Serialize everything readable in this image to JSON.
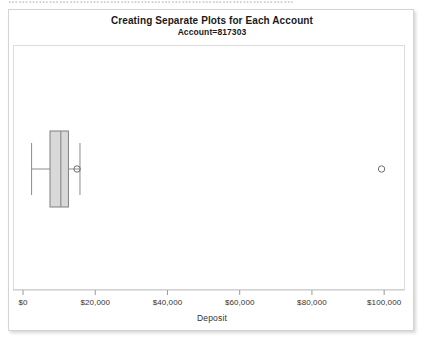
{
  "top_clip": {
    "text": "…………………………………………………………………………"
  },
  "header": {
    "title": "Creating Separate Plots for Each Account",
    "subtitle": "Account=817303"
  },
  "colors": {
    "frame": "#dcdcdc",
    "box_fill": "#d9d9d9",
    "box_stroke": "#808080",
    "whisker": "#8c8c8c",
    "median": "#808080",
    "marker": "#6e6e6e",
    "text": "#333333",
    "panel_border": "#d4d4d4"
  },
  "chart_data": {
    "type": "box",
    "orientation": "horizontal",
    "title": "Creating Separate Plots for Each Account",
    "subtitle": "Account=817303",
    "xlabel": "Deposit",
    "ylabel": "",
    "grid": false,
    "legend": "none",
    "xlim": [
      0,
      103000
    ],
    "xticks": [
      0,
      20000,
      40000,
      60000,
      80000,
      100000
    ],
    "xticklabels": [
      "$0",
      "$20,000",
      "$40,000",
      "$60,000",
      "$80,000",
      "$100,000"
    ],
    "categories": [
      "Account=817303"
    ],
    "series": [
      {
        "name": "Deposit",
        "min_whisker": 2100,
        "q1": 7200,
        "median": 10200,
        "q3": 12300,
        "max_whisker": 15500,
        "mean": 14700,
        "outliers": [
          99000
        ]
      }
    ],
    "annotations": []
  }
}
